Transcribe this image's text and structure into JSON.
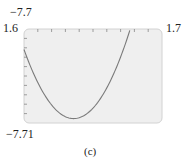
{
  "chart_data": {
    "type": "line",
    "title": "",
    "caption": "(c)",
    "xlabel": "",
    "ylabel": "",
    "xlim": [
      1.6,
      1.7
    ],
    "ylim": [
      -7.71,
      -7.7
    ],
    "x_tick_count": 10,
    "y_tick_count": 10,
    "grid": false,
    "series": [
      {
        "name": "curve",
        "color": "#7a7a7a",
        "x": [
          1.6,
          1.61,
          1.62,
          1.63,
          1.635,
          1.64,
          1.65,
          1.66,
          1.67,
          1.677
        ],
        "y": [
          -7.7044,
          -7.7066,
          -7.7083,
          -7.7093,
          -7.7095,
          -7.7094,
          -7.7082,
          -7.706,
          -7.7029,
          -7.7
        ]
      }
    ],
    "labels": {
      "x_min": "1.6",
      "x_max": "1.7",
      "y_max": "−7.7",
      "y_min": "−7.71"
    },
    "colors": {
      "plot_background": "#efefef",
      "plot_border": "#cfcfcf",
      "curve": "#7a7a7a"
    }
  }
}
